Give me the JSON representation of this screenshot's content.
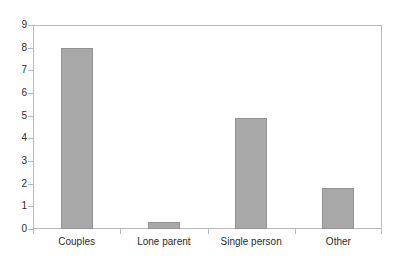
{
  "chart_data": {
    "type": "bar",
    "title": "",
    "subtitle": "",
    "xlabel": "",
    "ylabel": "",
    "categories": [
      "Couples",
      "Lone parent",
      "Single person",
      "Other"
    ],
    "values": [
      8.0,
      0.3,
      4.9,
      1.8
    ],
    "ylim": [
      0,
      9
    ],
    "ytick_labels": [
      "0",
      "1",
      "2",
      "3",
      "4",
      "5",
      "6",
      "7",
      "8",
      "9"
    ],
    "ytick_values": [
      0,
      1,
      2,
      3,
      4,
      5,
      6,
      7,
      8,
      9
    ],
    "grid": false,
    "legend": false,
    "legend_position": "none",
    "annotations": [],
    "bar_color": "#a8a8a8",
    "bar_border_color": "#949494",
    "axis_color": "#b9b9b9",
    "text_color": "#2b2b2b",
    "background_color": "#ffffff"
  }
}
